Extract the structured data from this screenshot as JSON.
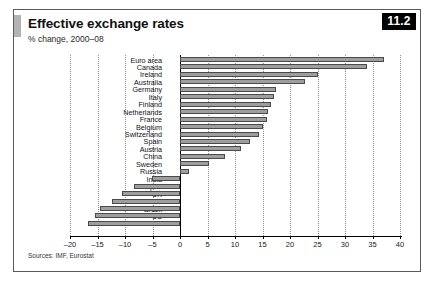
{
  "figure": {
    "badge": "11.2",
    "title": "Effective exchange rates",
    "subtitle": "% change, 2000–08",
    "source": "Sources: IMF, Eurostat",
    "accent_color": "#b3b3b3",
    "bar_fill": "#9e9e9e",
    "bar_stroke": "#4a4a4a",
    "badge_bg": "#000000",
    "badge_fg": "#ffffff"
  },
  "chart_data": {
    "type": "bar",
    "orientation": "horizontal",
    "title": "Effective exchange rates",
    "subtitle": "% change, 2000–08",
    "xlabel": "",
    "ylabel": "",
    "xlim": [
      -20,
      40
    ],
    "xticks": [
      -20,
      -15,
      -10,
      -5,
      0,
      5,
      10,
      15,
      20,
      25,
      30,
      35,
      40
    ],
    "xtick_labels": [
      "–20",
      "–15",
      "–10",
      "–5",
      "0",
      "5",
      "10",
      "15",
      "20",
      "25",
      "30",
      "35",
      "40"
    ],
    "grid": true,
    "legend": false,
    "source": "Sources: IMF, Eurostat",
    "categories": [
      "Euro area",
      "Canada",
      "Ireland",
      "Australia",
      "Germany",
      "Italy",
      "Finland",
      "Netherlands",
      "France",
      "Belgium",
      "Switzerland",
      "Spain",
      "Austria",
      "China",
      "Sweden",
      "Russia",
      "India",
      "Japan",
      "UK",
      "South Korea",
      "Brazil",
      "US",
      "Mexico"
    ],
    "values": [
      37.0,
      34.0,
      25.0,
      22.7,
      17.5,
      17.0,
      16.5,
      16.0,
      15.8,
      15.0,
      14.4,
      12.7,
      11.0,
      8.2,
      5.3,
      1.6,
      -5.1,
      -8.4,
      -10.5,
      -12.4,
      -14.5,
      -15.5,
      -16.7
    ]
  }
}
